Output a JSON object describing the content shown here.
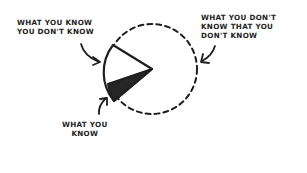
{
  "diagram": {
    "type": "knowledge-circle",
    "colors": {
      "ink": "#1e1e1e",
      "background": "#ffffff",
      "known_fill": "#262626"
    },
    "labels": {
      "known_unknowns": {
        "lines": [
          "What you know",
          "you don't know"
        ]
      },
      "unknown_unknowns": {
        "lines": [
          "What you don't",
          "know that you",
          "don't know"
        ]
      },
      "known": {
        "lines": [
          "What you",
          "know"
        ]
      }
    },
    "regions": [
      {
        "name": "what-you-know",
        "style": "filled-dark"
      },
      {
        "name": "what-you-know-you-dont-know",
        "style": "outlined-white"
      },
      {
        "name": "what-you-dont-know-that-you-dont-know",
        "style": "dashed-circle"
      }
    ]
  }
}
